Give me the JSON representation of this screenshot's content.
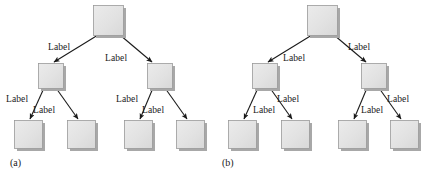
{
  "figure": {
    "background_color": "#ffffff",
    "node_fill_color": "#e2e2e2",
    "node_border_color": "#9a9a9a",
    "node_shadow_color": "#a8a8a8",
    "edge_color": "#1a1a1a",
    "text_color": "#1a1a1a",
    "label_text": "Label"
  },
  "panels": [
    {
      "id": "a",
      "caption": "(a)",
      "caption_x": 10,
      "caption_y": 158,
      "nodes": [
        {
          "id": "a-root",
          "name": "root-node",
          "x": 93,
          "y": 5,
          "w": 30,
          "h": 30
        },
        {
          "id": "a-mid-left",
          "name": "internal-node-left",
          "x": 38,
          "y": 63,
          "w": 25,
          "h": 25
        },
        {
          "id": "a-mid-right",
          "name": "internal-node-right",
          "x": 147,
          "y": 63,
          "w": 25,
          "h": 25
        },
        {
          "id": "a-leaf-1",
          "name": "leaf-node-1",
          "x": 14,
          "y": 120,
          "w": 28,
          "h": 28
        },
        {
          "id": "a-leaf-2",
          "name": "leaf-node-2",
          "x": 67,
          "y": 120,
          "w": 28,
          "h": 28
        },
        {
          "id": "a-leaf-3",
          "name": "leaf-node-3",
          "x": 124,
          "y": 120,
          "w": 28,
          "h": 28
        },
        {
          "id": "a-leaf-4",
          "name": "leaf-node-4",
          "x": 176,
          "y": 120,
          "w": 28,
          "h": 28
        }
      ],
      "edges": [
        {
          "id": "a-e1",
          "name": "edge-root-to-left",
          "x1": 98,
          "y1": 35,
          "x2": 54,
          "y2": 62
        },
        {
          "id": "a-e2",
          "name": "edge-root-to-right",
          "x1": 120,
          "y1": 35,
          "x2": 152,
          "y2": 62
        },
        {
          "id": "a-e3",
          "name": "edge-left-to-leaf1",
          "x1": 44,
          "y1": 88,
          "x2": 30,
          "y2": 119
        },
        {
          "id": "a-e4",
          "name": "edge-left-to-leaf2",
          "x1": 56,
          "y1": 88,
          "x2": 78,
          "y2": 119
        },
        {
          "id": "a-e5",
          "name": "edge-right-to-leaf3",
          "x1": 153,
          "y1": 88,
          "x2": 140,
          "y2": 119
        },
        {
          "id": "a-e6",
          "name": "edge-right-to-leaf4",
          "x1": 165,
          "y1": 88,
          "x2": 187,
          "y2": 119
        }
      ],
      "labels": [
        {
          "id": "a-l1",
          "name": "edge-label-root-left",
          "text": "Label",
          "x": 48,
          "y": 43
        },
        {
          "id": "a-l2",
          "name": "edge-label-root-right",
          "text": "Label",
          "x": 105,
          "y": 54
        },
        {
          "id": "a-l3",
          "name": "edge-label-left-leaf1",
          "text": "Label",
          "x": 6,
          "y": 95
        },
        {
          "id": "a-l4",
          "name": "edge-label-left-leaf2",
          "text": "Label",
          "x": 33,
          "y": 106
        },
        {
          "id": "a-l5",
          "name": "edge-label-right-leaf3",
          "text": "Label",
          "x": 116,
          "y": 95
        },
        {
          "id": "a-l6",
          "name": "edge-label-right-leaf4",
          "text": "Label",
          "x": 142,
          "y": 106
        }
      ]
    },
    {
      "id": "b",
      "caption": "(b)",
      "caption_x": 222,
      "caption_y": 158,
      "nodes": [
        {
          "id": "b-root",
          "name": "root-node",
          "x": 307,
          "y": 5,
          "w": 30,
          "h": 30
        },
        {
          "id": "b-mid-left",
          "name": "internal-node-left",
          "x": 252,
          "y": 63,
          "w": 25,
          "h": 25
        },
        {
          "id": "b-mid-right",
          "name": "internal-node-right",
          "x": 361,
          "y": 63,
          "w": 25,
          "h": 25
        },
        {
          "id": "b-leaf-1",
          "name": "leaf-node-1",
          "x": 228,
          "y": 120,
          "w": 28,
          "h": 28
        },
        {
          "id": "b-leaf-2",
          "name": "leaf-node-2",
          "x": 281,
          "y": 120,
          "w": 28,
          "h": 28
        },
        {
          "id": "b-leaf-3",
          "name": "leaf-node-3",
          "x": 338,
          "y": 120,
          "w": 28,
          "h": 28
        },
        {
          "id": "b-leaf-4",
          "name": "leaf-node-4",
          "x": 390,
          "y": 120,
          "w": 28,
          "h": 28
        }
      ],
      "edges": [
        {
          "id": "b-e1",
          "name": "edge-root-to-left",
          "x1": 312,
          "y1": 35,
          "x2": 268,
          "y2": 62
        },
        {
          "id": "b-e2",
          "name": "edge-root-to-right",
          "x1": 334,
          "y1": 35,
          "x2": 366,
          "y2": 62
        },
        {
          "id": "b-e3",
          "name": "edge-left-to-leaf1",
          "x1": 258,
          "y1": 88,
          "x2": 244,
          "y2": 119
        },
        {
          "id": "b-e4",
          "name": "edge-left-to-leaf2",
          "x1": 270,
          "y1": 88,
          "x2": 292,
          "y2": 119
        },
        {
          "id": "b-e5",
          "name": "edge-right-to-leaf3",
          "x1": 367,
          "y1": 88,
          "x2": 354,
          "y2": 119
        },
        {
          "id": "b-e6",
          "name": "edge-right-to-leaf4",
          "x1": 379,
          "y1": 88,
          "x2": 401,
          "y2": 119
        }
      ],
      "labels": [
        {
          "id": "b-l1",
          "name": "edge-label-root-left",
          "text": "Label",
          "x": 283,
          "y": 54
        },
        {
          "id": "b-l2",
          "name": "edge-label-root-right",
          "text": "Label",
          "x": 348,
          "y": 43
        },
        {
          "id": "b-l3",
          "name": "edge-label-left-leaf1",
          "text": "Label",
          "x": 253,
          "y": 106
        },
        {
          "id": "b-l4",
          "name": "edge-label-left-leaf2",
          "text": "Label",
          "x": 277,
          "y": 95
        },
        {
          "id": "b-l5",
          "name": "edge-label-right-leaf3",
          "text": "Label",
          "x": 361,
          "y": 106
        },
        {
          "id": "b-l6",
          "name": "edge-label-right-leaf4",
          "text": "Label",
          "x": 387,
          "y": 95
        }
      ]
    }
  ]
}
